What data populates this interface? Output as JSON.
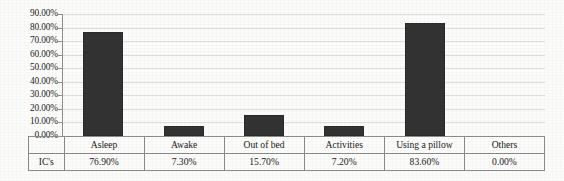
{
  "chart_data": {
    "type": "bar",
    "title": "",
    "xlabel": "",
    "ylabel": "",
    "categories": [
      "Asleep",
      "Awake",
      "Out of bed",
      "Activities",
      "Using a pillow",
      "Others"
    ],
    "values": [
      76.9,
      7.3,
      15.7,
      7.2,
      83.6,
      0.0
    ],
    "value_labels": [
      "76.90%",
      "7.30%",
      "15.70%",
      "7.20%",
      "83.60%",
      "0.00%"
    ],
    "series": [
      {
        "name": "IC's",
        "values": [
          76.9,
          7.3,
          15.7,
          7.2,
          83.6,
          0.0
        ]
      }
    ],
    "ylim": [
      0,
      90
    ],
    "ytick_values": [
      0,
      10,
      20,
      30,
      40,
      50,
      60,
      70,
      80,
      90
    ],
    "ytick_labels": [
      "0.00%",
      "10.00%",
      "20.00%",
      "30.00%",
      "40.00%",
      "50.00%",
      "60.00%",
      "70.00%",
      "80.00%",
      "90.00%"
    ],
    "grid": true,
    "legend": false,
    "legend_position": "none",
    "bar_color": "#333333",
    "gridline_color": "#dcdcdc",
    "axis_color": "#8f8f8f"
  },
  "data_table": {
    "row_label": "IC's",
    "headers": [
      "Asleep",
      "Awake",
      "Out of bed",
      "Activities",
      "Using a pillow",
      "Others"
    ],
    "values": [
      "76.90%",
      "7.30%",
      "15.70%",
      "7.20%",
      "83.60%",
      "0.00%"
    ]
  }
}
